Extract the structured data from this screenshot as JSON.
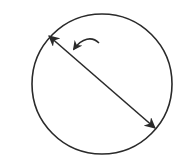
{
  "diagram": {
    "type": "circle-with-diameter",
    "stroke_color": "#2a2a2a",
    "background": "#ffffff",
    "circle": {
      "cx": 102,
      "cy": 84,
      "r": 70
    },
    "diameter": {
      "x1": 49,
      "y1": 36,
      "x2": 155,
      "y2": 128,
      "arrowheads": "both"
    },
    "pointer_arrow": {
      "path": "M99,43 C92,36 82,38 74,49",
      "points_to": "diameter"
    },
    "labels": []
  }
}
